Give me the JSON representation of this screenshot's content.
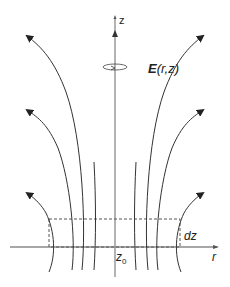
{
  "diagram": {
    "labels": {
      "z_axis": "z",
      "r_axis": "r",
      "field_bold": "E",
      "field_args": "(r,z)",
      "z0_main": "z",
      "z0_sub": "0",
      "dz": "dz"
    },
    "colors": {
      "axis": "#8a8a8a",
      "field_line": "#333333",
      "dashed_box": "#555555",
      "text": "#222222"
    }
  }
}
